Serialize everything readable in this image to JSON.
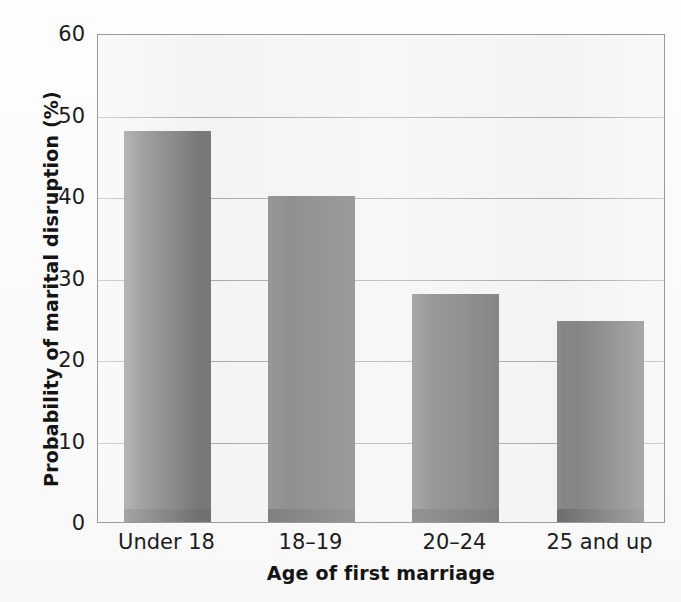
{
  "chart_data": {
    "type": "bar",
    "title": "",
    "subtitle": "",
    "xlabel": "Age of first marriage",
    "ylabel": "Probability of marital disruption (%)",
    "categories": [
      "Under 18",
      "18–19",
      "20–24",
      "25 and up"
    ],
    "values": [
      48,
      40,
      28,
      24.7
    ],
    "ylim": [
      0,
      60
    ],
    "yticks": [
      0,
      10,
      20,
      30,
      40,
      50,
      60
    ],
    "ytick_labels": [
      "0",
      "10",
      "20",
      "30",
      "40",
      "50",
      "60"
    ],
    "grid": true,
    "grid_axis": "y",
    "legend": false,
    "legend_position": "none",
    "series": [
      {
        "name": "Probability of marital disruption",
        "values": [
          48,
          40,
          28,
          24.7
        ]
      }
    ],
    "annotations": []
  },
  "style": {
    "bar_color": "#6d6d6d",
    "bar_foot_color": "#5f5f5f",
    "plot_background": "#f2f2f2",
    "gridline_color": "#9d9d9d",
    "axis_color": "#9a9a9a",
    "text_color": "#1c1c1c",
    "page_background": "#ffffff"
  },
  "geometry": {
    "plot_left": 97,
    "plot_top": 34,
    "plot_width": 568,
    "plot_height": 489,
    "bar_width_px": 87,
    "bar_lefts_px": [
      26,
      170,
      314,
      459
    ]
  }
}
